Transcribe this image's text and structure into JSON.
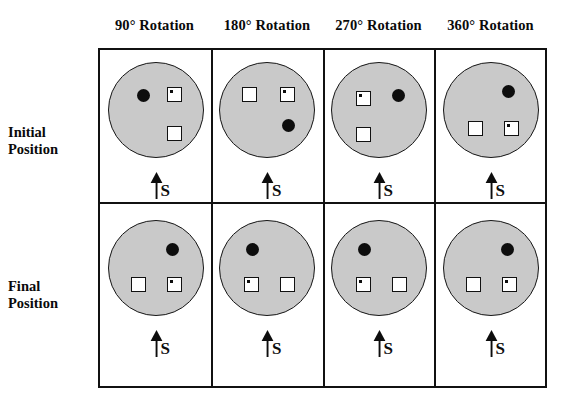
{
  "figure": {
    "background_color": "#ffffff",
    "disc_fill_color": "#c9c9c9",
    "disc_stroke_color": "#161616",
    "ink_color": "#0d0d0d",
    "grid_border_color": "#111111"
  },
  "columns": [
    {
      "id": "rot90",
      "label": "90° Rotation"
    },
    {
      "id": "rot180",
      "label": "180° Rotation"
    },
    {
      "id": "rot270",
      "label": "270° Rotation"
    },
    {
      "id": "rot360",
      "label": "360° Rotation"
    }
  ],
  "rows": [
    {
      "id": "initial",
      "label_line1": "Initial",
      "label_line2": "Position"
    },
    {
      "id": "final",
      "label_line1": "Final",
      "label_line2": "Position"
    }
  ],
  "marker": {
    "icon": "up-arrow-icon",
    "letter": "S",
    "meaning": "South / start reference direction"
  },
  "legend_objects": {
    "filled_circle": "black-dot-object",
    "dotted_square": "square-with-dot-object",
    "empty_square": "empty-square-object"
  },
  "cells": [
    {
      "row": "initial",
      "column": "rot90",
      "objects": [
        {
          "kind": "dot",
          "name": "black-dot-object",
          "x": 28,
          "y": 26
        },
        {
          "kind": "square-dot",
          "name": "square-with-dot-object",
          "x": 58,
          "y": 24
        },
        {
          "kind": "square-empty",
          "name": "empty-square-object",
          "x": 58,
          "y": 63
        }
      ]
    },
    {
      "row": "initial",
      "column": "rot180",
      "objects": [
        {
          "kind": "square-empty",
          "name": "empty-square-object",
          "x": 22,
          "y": 24
        },
        {
          "kind": "square-dot",
          "name": "square-with-dot-object",
          "x": 60,
          "y": 24
        },
        {
          "kind": "dot",
          "name": "black-dot-object",
          "x": 62,
          "y": 56
        }
      ]
    },
    {
      "row": "initial",
      "column": "rot270",
      "objects": [
        {
          "kind": "square-dot",
          "name": "square-with-dot-object",
          "x": 24,
          "y": 28
        },
        {
          "kind": "dot",
          "name": "black-dot-object",
          "x": 60,
          "y": 26
        },
        {
          "kind": "square-empty",
          "name": "empty-square-object",
          "x": 24,
          "y": 64
        }
      ]
    },
    {
      "row": "initial",
      "column": "rot360",
      "objects": [
        {
          "kind": "dot",
          "name": "black-dot-object",
          "x": 58,
          "y": 22
        },
        {
          "kind": "square-empty",
          "name": "empty-square-object",
          "x": 24,
          "y": 58
        },
        {
          "kind": "square-dot",
          "name": "square-with-dot-object",
          "x": 60,
          "y": 58
        }
      ]
    },
    {
      "row": "final",
      "column": "rot90",
      "objects": [
        {
          "kind": "dot",
          "name": "black-dot-object",
          "x": 57,
          "y": 22
        },
        {
          "kind": "square-empty",
          "name": "empty-square-object",
          "x": 22,
          "y": 56
        },
        {
          "kind": "square-dot",
          "name": "square-with-dot-object",
          "x": 58,
          "y": 56
        }
      ]
    },
    {
      "row": "final",
      "column": "rot180",
      "objects": [
        {
          "kind": "dot",
          "name": "black-dot-object",
          "x": 26,
          "y": 22
        },
        {
          "kind": "square-dot",
          "name": "square-with-dot-object",
          "x": 24,
          "y": 56
        },
        {
          "kind": "square-empty",
          "name": "empty-square-object",
          "x": 60,
          "y": 56
        }
      ]
    },
    {
      "row": "final",
      "column": "rot270",
      "objects": [
        {
          "kind": "dot",
          "name": "black-dot-object",
          "x": 26,
          "y": 22
        },
        {
          "kind": "square-dot",
          "name": "square-with-dot-object",
          "x": 24,
          "y": 56
        },
        {
          "kind": "square-empty",
          "name": "empty-square-object",
          "x": 60,
          "y": 56
        }
      ]
    },
    {
      "row": "final",
      "column": "rot360",
      "objects": [
        {
          "kind": "dot",
          "name": "black-dot-object",
          "x": 57,
          "y": 22
        },
        {
          "kind": "square-empty",
          "name": "empty-square-object",
          "x": 22,
          "y": 56
        },
        {
          "kind": "square-dot",
          "name": "square-with-dot-object",
          "x": 58,
          "y": 56
        }
      ]
    }
  ]
}
